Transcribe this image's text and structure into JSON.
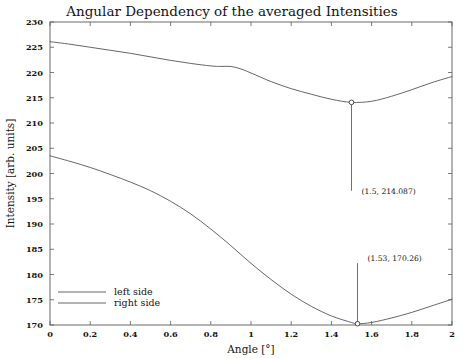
{
  "chart_data": {
    "type": "line",
    "title": "Angular Dependency of the averaged Intensities",
    "xlabel": "Angle  [°]",
    "ylabel": "Intensity [arb. units]",
    "xlim": [
      0,
      2
    ],
    "ylim": [
      170,
      230
    ],
    "grid": false,
    "legend_position": "bottom-left",
    "xticks": [
      0,
      0.2,
      0.4,
      0.6,
      0.8,
      1,
      1.2,
      1.4,
      1.6,
      1.8,
      2
    ],
    "xticklabels": [
      "0",
      "0.2",
      "0.4",
      "0.6",
      "0.8",
      "1",
      "1.2",
      "1.4",
      "1.6",
      "1.8",
      "2"
    ],
    "yticks": [
      170,
      175,
      180,
      185,
      190,
      195,
      200,
      205,
      210,
      215,
      220,
      225,
      230
    ],
    "yticklabels": [
      "170",
      "175",
      "180",
      "185",
      "190",
      "195",
      "200",
      "205",
      "210",
      "215",
      "220",
      "225",
      "230"
    ],
    "series": [
      {
        "name": "left side",
        "color": "#555555",
        "x": [
          0,
          0.1,
          0.2,
          0.3,
          0.4,
          0.5,
          0.6,
          0.7,
          0.8,
          0.85,
          0.9,
          0.95,
          1.0,
          1.1,
          1.2,
          1.3,
          1.4,
          1.5,
          1.6,
          1.7,
          1.8,
          1.9,
          2.0
        ],
        "values": [
          226.1,
          225.6,
          225.0,
          224.4,
          223.8,
          223.1,
          222.4,
          221.8,
          221.3,
          221.2,
          221.2,
          220.7,
          219.9,
          218.2,
          216.8,
          215.7,
          214.7,
          214.087,
          214.3,
          215.3,
          216.6,
          218.0,
          219.2
        ]
      },
      {
        "name": "right side",
        "color": "#555555",
        "x": [
          0,
          0.1,
          0.2,
          0.3,
          0.4,
          0.5,
          0.6,
          0.7,
          0.8,
          0.9,
          1.0,
          1.1,
          1.2,
          1.3,
          1.4,
          1.5,
          1.53,
          1.6,
          1.7,
          1.8,
          1.9,
          2.0
        ],
        "values": [
          203.5,
          202.4,
          201.2,
          199.8,
          198.3,
          196.6,
          194.5,
          192.0,
          189.0,
          185.7,
          182.2,
          179.0,
          176.1,
          173.7,
          171.8,
          170.5,
          170.26,
          170.5,
          171.4,
          172.5,
          173.8,
          175.1
        ]
      }
    ],
    "annotations": [
      {
        "name": "left-side-minimum",
        "label": "(1.5, 214.087)",
        "x": 1.5,
        "y": 214.087,
        "marker": true,
        "leader_direction": "down",
        "leader_length_units": 17.5,
        "label_dx_units": 0.03
      },
      {
        "name": "right-side-minimum",
        "label": "(1.53, 170.26)",
        "x": 1.53,
        "y": 170.26,
        "marker": true,
        "leader_direction": "up",
        "leader_length_units": 12.0,
        "label_dx_units": 0.03
      }
    ]
  }
}
